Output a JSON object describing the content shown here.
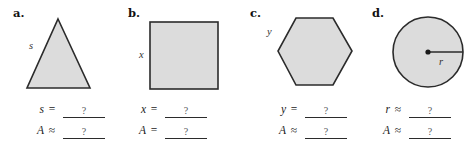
{
  "figure": {
    "shape_fill": "#dcdcdc",
    "shape_stroke": "#2b2b2b",
    "blank_value": "?",
    "panels": [
      {
        "letter": "a.",
        "shape": "triangle",
        "shape_label": "s",
        "answers": [
          {
            "variable": "s",
            "relation": "=",
            "value": "?"
          },
          {
            "variable": "A",
            "relation": "≈",
            "value": "?"
          }
        ]
      },
      {
        "letter": "b.",
        "shape": "square",
        "shape_label": "x",
        "answers": [
          {
            "variable": "x",
            "relation": "=",
            "value": "?"
          },
          {
            "variable": "A",
            "relation": "=",
            "value": "?"
          }
        ]
      },
      {
        "letter": "c.",
        "shape": "hexagon",
        "shape_label": "y",
        "answers": [
          {
            "variable": "y",
            "relation": "=",
            "value": "?"
          },
          {
            "variable": "A",
            "relation": "≈",
            "value": "?"
          }
        ]
      },
      {
        "letter": "d.",
        "shape": "circle",
        "shape_label": "r",
        "answers": [
          {
            "variable": "r",
            "relation": "≈",
            "value": "?"
          },
          {
            "variable": "A",
            "relation": "≈",
            "value": "?"
          }
        ]
      }
    ]
  }
}
